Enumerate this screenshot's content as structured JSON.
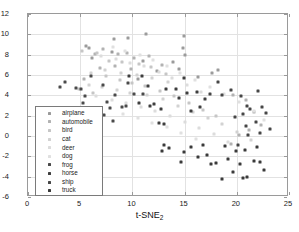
{
  "chart_data": {
    "type": "scatter",
    "title": "",
    "xlabel": "t-SNE_2",
    "xlabel_base": "t-SNE",
    "xlabel_sub": "2",
    "ylabel": "",
    "xlim": [
      0,
      25
    ],
    "ylim": [
      -6,
      12
    ],
    "xticks": [
      0,
      5,
      10,
      15,
      20,
      25
    ],
    "yticks": [
      12,
      10,
      8,
      6,
      4,
      2,
      0,
      -2,
      -4,
      -6
    ],
    "grid": true,
    "legend_position": "left-lower",
    "series": [
      {
        "name": "airplane",
        "color": "#9b9b9b",
        "points": [
          [
            5.6,
            8.9
          ],
          [
            5.8,
            8.7
          ],
          [
            8.2,
            9.5
          ],
          [
            9.6,
            9.6
          ],
          [
            11.3,
            10.0
          ],
          [
            14.9,
            9.8
          ],
          [
            14.8,
            8.7
          ],
          [
            15.0,
            8.0
          ],
          [
            11.0,
            7.4
          ],
          [
            13.9,
            7.3
          ],
          [
            12.4,
            6.4
          ],
          [
            14.5,
            6.6
          ],
          [
            8.0,
            8.3
          ],
          [
            6.1,
            7.7
          ],
          [
            18.2,
            6.5
          ],
          [
            17.6,
            6.2
          ],
          [
            10.5,
            5.6
          ],
          [
            16.3,
            5.8
          ]
        ]
      },
      {
        "name": "automobile",
        "color": "#b2b2b2",
        "points": [
          [
            6.4,
            8.1
          ],
          [
            7.2,
            8.6
          ],
          [
            8.6,
            8.1
          ],
          [
            9.5,
            8.2
          ],
          [
            10.2,
            7.7
          ],
          [
            11.6,
            7.9
          ],
          [
            12.8,
            7.0
          ],
          [
            6.9,
            6.7
          ],
          [
            8.3,
            6.9
          ],
          [
            9.9,
            6.6
          ],
          [
            5.4,
            5.6
          ],
          [
            19.6,
            4.0
          ],
          [
            20.9,
            3.5
          ],
          [
            21.6,
            2.4
          ],
          [
            22.3,
            1.1
          ],
          [
            21.2,
            0.6
          ],
          [
            20.2,
            0.1
          ],
          [
            19.4,
            -0.8
          ]
        ]
      },
      {
        "name": "bird",
        "color": "#c6c6c6",
        "points": [
          [
            5.2,
            8.4
          ],
          [
            6.6,
            8.2
          ],
          [
            7.8,
            7.4
          ],
          [
            9.0,
            7.3
          ],
          [
            10.6,
            7.1
          ],
          [
            11.8,
            6.8
          ],
          [
            13.2,
            6.1
          ],
          [
            7.5,
            5.9
          ],
          [
            8.8,
            5.5
          ],
          [
            10.0,
            5.2
          ],
          [
            11.2,
            4.9
          ],
          [
            12.6,
            4.4
          ],
          [
            4.9,
            4.6
          ],
          [
            6.2,
            4.2
          ],
          [
            14.0,
            3.9
          ],
          [
            15.4,
            3.2
          ],
          [
            16.8,
            2.6
          ],
          [
            18.0,
            2.0
          ]
        ]
      },
      {
        "name": "cat",
        "color": "#d2d2d2",
        "points": [
          [
            6.0,
            6.2
          ],
          [
            7.4,
            6.5
          ],
          [
            8.9,
            6.2
          ],
          [
            10.4,
            6.0
          ],
          [
            11.9,
            5.7
          ],
          [
            13.4,
            5.3
          ],
          [
            5.8,
            5.0
          ],
          [
            7.1,
            4.8
          ],
          [
            8.5,
            4.5
          ],
          [
            9.8,
            4.2
          ],
          [
            11.4,
            4.0
          ],
          [
            12.9,
            3.6
          ],
          [
            14.4,
            3.0
          ],
          [
            15.8,
            2.4
          ],
          [
            17.2,
            1.8
          ],
          [
            18.6,
            1.2
          ],
          [
            20.0,
            0.4
          ],
          [
            21.4,
            -0.4
          ]
        ]
      },
      {
        "name": "deer",
        "color": "#dcdcdc",
        "points": [
          [
            7.0,
            7.9
          ],
          [
            8.4,
            7.6
          ],
          [
            9.8,
            7.2
          ],
          [
            11.1,
            6.9
          ],
          [
            12.5,
            6.3
          ],
          [
            13.8,
            5.7
          ],
          [
            15.2,
            5.0
          ],
          [
            16.6,
            4.3
          ],
          [
            6.5,
            3.9
          ],
          [
            8.0,
            3.5
          ],
          [
            9.4,
            3.2
          ],
          [
            10.8,
            2.9
          ],
          [
            12.2,
            2.5
          ],
          [
            13.6,
            2.0
          ],
          [
            15.0,
            1.4
          ],
          [
            16.4,
            0.8
          ],
          [
            17.8,
            0.2
          ],
          [
            19.2,
            -0.6
          ]
        ]
      },
      {
        "name": "dog",
        "color": "#e0e0e0",
        "points": [
          [
            8.1,
            8.8
          ],
          [
            9.3,
            8.4
          ],
          [
            10.7,
            8.0
          ],
          [
            12.0,
            7.5
          ],
          [
            13.3,
            6.9
          ],
          [
            14.6,
            6.2
          ],
          [
            16.0,
            5.5
          ],
          [
            17.4,
            4.8
          ],
          [
            18.8,
            4.1
          ],
          [
            20.2,
            3.3
          ],
          [
            21.6,
            2.5
          ],
          [
            22.6,
            1.6
          ],
          [
            9.1,
            2.2
          ],
          [
            10.5,
            1.8
          ],
          [
            11.9,
            1.3
          ],
          [
            13.3,
            0.9
          ],
          [
            14.7,
            0.3
          ],
          [
            16.1,
            -0.3
          ]
        ]
      },
      {
        "name": "frog",
        "color": "#4a4a4a",
        "points": [
          [
            3.1,
            4.8
          ],
          [
            3.5,
            5.3
          ],
          [
            4.6,
            4.7
          ],
          [
            5.1,
            4.6
          ],
          [
            5.3,
            3.2
          ],
          [
            5.5,
            3.9
          ],
          [
            6.0,
            5.9
          ],
          [
            7.2,
            5.0
          ],
          [
            8.3,
            4.0
          ],
          [
            7.6,
            3.3
          ],
          [
            7.9,
            2.8
          ],
          [
            9.0,
            2.9
          ],
          [
            9.4,
            3.0
          ],
          [
            8.1,
            1.5
          ],
          [
            7.3,
            2.1
          ],
          [
            10.2,
            4.1
          ],
          [
            11.0,
            4.1
          ],
          [
            9.6,
            5.2
          ]
        ]
      },
      {
        "name": "horse",
        "color": "#3e3e3e",
        "points": [
          [
            9.7,
            5.9
          ],
          [
            10.9,
            5.9
          ],
          [
            11.5,
            4.9
          ],
          [
            12.1,
            3.1
          ],
          [
            11.7,
            3.0
          ],
          [
            10.6,
            3.2
          ],
          [
            12.7,
            2.7
          ],
          [
            13.2,
            4.6
          ],
          [
            14.2,
            4.6
          ],
          [
            14.9,
            5.7
          ],
          [
            15.2,
            4.2
          ],
          [
            14.5,
            3.7
          ],
          [
            13.0,
            1.2
          ],
          [
            12.5,
            1.3
          ],
          [
            16.2,
            4.3
          ],
          [
            17.0,
            3.6
          ],
          [
            16.5,
            2.9
          ],
          [
            15.6,
            2.5
          ]
        ]
      },
      {
        "name": "ship",
        "color": "#464646",
        "points": [
          [
            18.2,
            5.3
          ],
          [
            19.4,
            4.5
          ],
          [
            18.6,
            4.0
          ],
          [
            17.4,
            4.1
          ],
          [
            20.4,
            3.9
          ],
          [
            21.0,
            3.0
          ],
          [
            22.0,
            4.4
          ],
          [
            21.3,
            2.7
          ],
          [
            20.6,
            2.2
          ],
          [
            19.8,
            1.9
          ],
          [
            22.4,
            2.9
          ],
          [
            22.8,
            2.3
          ],
          [
            21.8,
            1.4
          ],
          [
            20.9,
            1.0
          ],
          [
            23.2,
            0.7
          ],
          [
            22.2,
            0.3
          ],
          [
            21.1,
            0.1
          ],
          [
            20.1,
            -0.9
          ]
        ]
      },
      {
        "name": "truck",
        "color": "#3a3a3a",
        "points": [
          [
            12.8,
            -1.5
          ],
          [
            13.5,
            -1.2
          ],
          [
            14.9,
            -1.6
          ],
          [
            15.6,
            -1.1
          ],
          [
            14.7,
            -2.6
          ],
          [
            16.3,
            -2.1
          ],
          [
            17.1,
            -1.9
          ],
          [
            18.0,
            -2.7
          ],
          [
            18.6,
            -4.2
          ],
          [
            19.2,
            -2.3
          ],
          [
            19.9,
            -1.5
          ],
          [
            20.6,
            -4.1
          ],
          [
            21.0,
            -4.0
          ],
          [
            21.6,
            -2.5
          ],
          [
            22.2,
            -2.6
          ],
          [
            22.6,
            -3.3
          ],
          [
            20.3,
            -2.8
          ],
          [
            17.5,
            -2.8
          ],
          [
            19.6,
            -3.5
          ],
          [
            16.8,
            -0.9
          ],
          [
            18.9,
            -1.0
          ],
          [
            21.9,
            -1.1
          ],
          [
            20.8,
            -1.4
          ],
          [
            13.0,
            -0.9
          ]
        ]
      }
    ]
  },
  "legend": {
    "items": [
      {
        "label": "airplane"
      },
      {
        "label": "automobile"
      },
      {
        "label": "bird"
      },
      {
        "label": "cat"
      },
      {
        "label": "deer"
      },
      {
        "label": "dog"
      },
      {
        "label": "frog"
      },
      {
        "label": "horse"
      },
      {
        "label": "ship"
      },
      {
        "label": "truck"
      }
    ]
  },
  "colors": {
    "frame": "#9a9a9a",
    "grid": "#e2e2e2",
    "text": "#1a1a1a",
    "background": "#ffffff"
  }
}
